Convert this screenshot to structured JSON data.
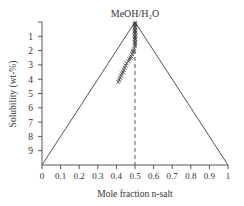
{
  "chart_data": {
    "type": "scatter",
    "title_display": "MeOH/H₂O",
    "xlabel": "Mole fraction n-salt",
    "ylabel": "Solubility (wt-%)",
    "xlim": [
      0,
      1
    ],
    "ylim": [
      10,
      0
    ],
    "y_inverted": true,
    "grid": false,
    "legend": null,
    "x_ticks": [
      "0",
      "0.1",
      "0.2",
      "0.3",
      "0.4",
      "0.5",
      "0.6",
      "0.7",
      "0.8",
      "0.9",
      "1"
    ],
    "y_ticks": [
      "1",
      "2",
      "3",
      "4",
      "5",
      "6",
      "7",
      "8",
      "9"
    ],
    "reference_lines": [
      {
        "type": "triangle",
        "vertices": [
          [
            0,
            10
          ],
          [
            0.5,
            0
          ],
          [
            1,
            10
          ]
        ],
        "style": "solid"
      },
      {
        "type": "vertical",
        "x": 0.5,
        "from": 0,
        "to": 10,
        "style": "dashed"
      }
    ],
    "series": [
      {
        "name": "data",
        "marker": "x",
        "points": [
          [
            0.5,
            0.05
          ],
          [
            0.5,
            0.15
          ],
          [
            0.5,
            0.25
          ],
          [
            0.5,
            0.35
          ],
          [
            0.5,
            0.45
          ],
          [
            0.5,
            0.55
          ],
          [
            0.5,
            0.65
          ],
          [
            0.5,
            0.75
          ],
          [
            0.5,
            0.85
          ],
          [
            0.5,
            0.95
          ],
          [
            0.5,
            1.05
          ],
          [
            0.5,
            1.15
          ],
          [
            0.5,
            1.25
          ],
          [
            0.5,
            1.4
          ],
          [
            0.5,
            1.55
          ],
          [
            0.5,
            1.7
          ],
          [
            0.495,
            1.85
          ],
          [
            0.49,
            2.0
          ],
          [
            0.488,
            2.1
          ],
          [
            0.485,
            2.25
          ],
          [
            0.48,
            2.4
          ],
          [
            0.475,
            2.5
          ],
          [
            0.47,
            2.6
          ],
          [
            0.465,
            2.75
          ],
          [
            0.455,
            2.9
          ],
          [
            0.45,
            3.05
          ],
          [
            0.445,
            3.2
          ],
          [
            0.44,
            3.35
          ],
          [
            0.435,
            3.5
          ],
          [
            0.43,
            3.6
          ],
          [
            0.425,
            3.75
          ],
          [
            0.42,
            3.9
          ],
          [
            0.415,
            4.05
          ],
          [
            0.41,
            4.2
          ]
        ]
      }
    ]
  }
}
